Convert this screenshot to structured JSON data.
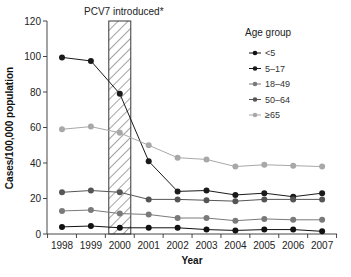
{
  "chart_data": {
    "type": "line",
    "title": "",
    "annotation": "PCV7 introduced*",
    "annotation_x": "2000",
    "xlabel": "Year",
    "ylabel": "Cases/100,000 population",
    "ylim": [
      0,
      120
    ],
    "yticks": [
      0,
      20,
      40,
      60,
      80,
      100,
      120
    ],
    "x": [
      "1998",
      "1999",
      "2000",
      "2001",
      "2002",
      "2003",
      "2004",
      "2005",
      "2006",
      "2007"
    ],
    "grid": false,
    "legend_title": "Age group",
    "legend_position": "upper right",
    "series": [
      {
        "name": "<5",
        "color": "#111111",
        "values": [
          4,
          4.5,
          3.5,
          3.5,
          3.5,
          2.5,
          2,
          2.5,
          2.5,
          1.5
        ]
      },
      {
        "name": "5–17",
        "color": "#1a1a1a",
        "values": [
          99.5,
          97.5,
          79,
          41,
          24,
          24.5,
          22,
          23,
          21,
          23
        ]
      },
      {
        "name": "18–49",
        "color": "#7a7a7a",
        "values": [
          13,
          13.5,
          11.5,
          11,
          9,
          9,
          7.5,
          8.5,
          8,
          8
        ]
      },
      {
        "name": "50–64",
        "color": "#555555",
        "values": [
          23.5,
          24.5,
          23.5,
          19.5,
          19.5,
          19,
          18.5,
          19.5,
          19.5,
          19.5
        ]
      },
      {
        "name": "≥65",
        "color": "#a8a8a8",
        "values": [
          59,
          60.5,
          57,
          50,
          43,
          42,
          38,
          39,
          38.5,
          38
        ]
      }
    ]
  }
}
